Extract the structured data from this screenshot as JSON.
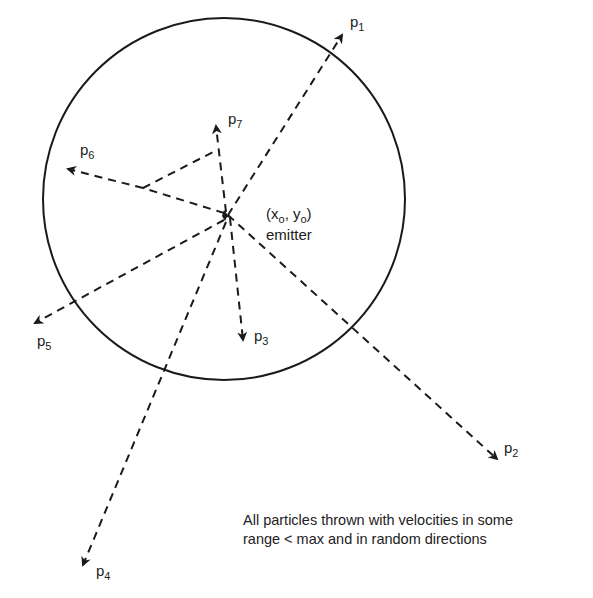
{
  "diagram": {
    "emitter": {
      "coord_label_x": "x",
      "coord_label_y": "y",
      "subscript": "o",
      "label": "emitter",
      "x": 228,
      "y": 215
    },
    "boundary_circle": {
      "cx": 224,
      "cy": 199,
      "r": 181
    },
    "particles": [
      {
        "id": "p1",
        "name": "p",
        "sub": "1"
      },
      {
        "id": "p2",
        "name": "p",
        "sub": "2"
      },
      {
        "id": "p3",
        "name": "p",
        "sub": "3"
      },
      {
        "id": "p4",
        "name": "p",
        "sub": "4"
      },
      {
        "id": "p5",
        "name": "p",
        "sub": "5"
      },
      {
        "id": "p6",
        "name": "p",
        "sub": "6"
      },
      {
        "id": "p7",
        "name": "p",
        "sub": "7"
      }
    ],
    "note": {
      "line1": "All particles thrown with velocities in some",
      "line2": "range < max and in random directions"
    },
    "colors": {
      "stroke": "#1a1a1a",
      "text": "#222222",
      "background": "#ffffff"
    }
  }
}
